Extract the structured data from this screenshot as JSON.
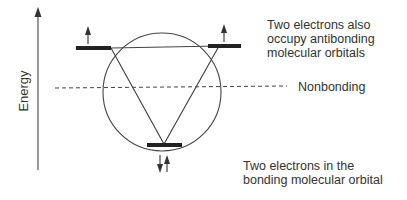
{
  "diagram": {
    "axis_label": "Energy",
    "labels": {
      "antibonding": [
        "Two electrons also",
        "occupy antibonding",
        "molecular orbitals"
      ],
      "nonbonding": "Nonbonding",
      "bonding": [
        "Two electrons in the",
        "bonding molecular orbital"
      ]
    },
    "levels": [
      {
        "name": "antibonding-left",
        "electrons": "up"
      },
      {
        "name": "antibonding-right",
        "electrons": "up"
      },
      {
        "name": "bonding",
        "electrons": "up-down"
      }
    ],
    "colors": {
      "line": "#333333",
      "bar": "#222222"
    }
  }
}
